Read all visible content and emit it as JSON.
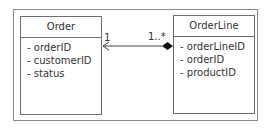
{
  "diagram": {
    "type": "uml-class-diagram",
    "classes": [
      {
        "name": "Order",
        "attributes": [
          "- orderID",
          "- customerID",
          "- status"
        ]
      },
      {
        "name": "OrderLine",
        "attributes": [
          "- orderLineID",
          "- orderID",
          "- productID"
        ]
      }
    ],
    "association": {
      "kind": "composition",
      "from": "OrderLine",
      "to": "Order",
      "navigable_to": "Order",
      "multiplicity_order": "1",
      "multiplicity_orderline": "1..*"
    }
  }
}
